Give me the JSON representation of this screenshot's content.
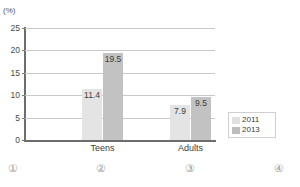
{
  "chart_data": {
    "type": "bar",
    "title": "",
    "subtitle": "",
    "xlabel": "",
    "ylabel": "(%)",
    "unit_label": "(%)",
    "categories": [
      "Teens",
      "Adults"
    ],
    "series": [
      {
        "name": "2011",
        "color": "#e4e4e4",
        "values": [
          11.4,
          7.9
        ],
        "labels": [
          "11.4",
          "7.9"
        ]
      },
      {
        "name": "2013",
        "color": "#c2c2c2",
        "values": [
          19.5,
          9.5
        ],
        "labels": [
          "19.5",
          "9.5"
        ]
      }
    ],
    "ylim": [
      0,
      25
    ],
    "ytick_values": [
      25,
      20,
      15,
      10,
      5,
      0
    ],
    "ytick_labels": [
      "25",
      "20",
      "15",
      "10",
      "5",
      "0"
    ],
    "grid": true,
    "legend_position": "right",
    "legend_entries": [
      "2011",
      "2013"
    ]
  },
  "answer_choices": [
    {
      "label": "①",
      "x": 8
    },
    {
      "label": "②",
      "x": 96
    },
    {
      "label": "③",
      "x": 185
    },
    {
      "label": "④",
      "x": 274
    }
  ]
}
